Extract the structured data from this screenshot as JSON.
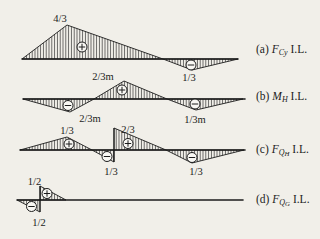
{
  "figure": {
    "bg_color": "#f1efe9",
    "ink_color": "#1c1c1c",
    "canvas": {
      "width": 320,
      "height": 239
    },
    "diagrams": [
      {
        "id": "a",
        "caption": {
          "prefix": "(a) ",
          "symbol": "F",
          "sub": "Cy",
          "subsub": "",
          "suffix": " I.L."
        },
        "caption_pos": {
          "x": 256,
          "y": 50
        },
        "baseline": {
          "x1": 22,
          "x2": 238,
          "y": 59
        },
        "regions": [
          {
            "points": "22,59 67,25 163,59",
            "sign": "plus",
            "sign_pos": {
              "x": 82,
              "y": 47
            }
          },
          {
            "points": "163,59 192,70 238,59",
            "sign": "minus",
            "sign_pos": {
              "x": 191,
              "y": 65
            }
          }
        ],
        "jumps": [],
        "labels": [
          {
            "text": "4/3",
            "x": 60,
            "y": 21.5
          },
          {
            "text": "1/3",
            "x": 189,
            "y": 81
          }
        ]
      },
      {
        "id": "b",
        "caption": {
          "prefix": "(b) ",
          "symbol": "M",
          "sub": "H",
          "subsub": "",
          "suffix": " I.L."
        },
        "caption_pos": {
          "x": 256,
          "y": 96.5
        },
        "baseline": {
          "x1": 23,
          "x2": 245,
          "y": 99
        },
        "regions": [
          {
            "points": "23,99 70,112 94,99",
            "sign": "minus",
            "sign_pos": {
              "x": 68,
              "y": 105.5
            }
          },
          {
            "points": "94,99 124,81 167,99",
            "sign": "plus",
            "sign_pos": {
              "x": 122,
              "y": 90
            }
          },
          {
            "points": "167,99 196,110 243,99",
            "sign": "minus",
            "sign_pos": {
              "x": 195,
              "y": 104
            }
          }
        ],
        "jumps": [],
        "labels": [
          {
            "text": "2/3m",
            "x": 103,
            "y": 79.5
          },
          {
            "text": "2/3m",
            "x": 90,
            "y": 122
          },
          {
            "text": "1/3m",
            "x": 195,
            "y": 122.5
          }
        ]
      },
      {
        "id": "c",
        "caption": {
          "prefix": "(c) ",
          "symbol": "F",
          "sub": "Q",
          "subsub": "H",
          "suffix": " I.L."
        },
        "caption_pos": {
          "x": 256,
          "y": 150
        },
        "baseline": {
          "x1": 20,
          "x2": 245,
          "y": 150
        },
        "regions": [
          {
            "points": "20,150 67,137 92,150",
            "sign": "plus",
            "sign_pos": {
              "x": 69,
              "y": 144
            }
          },
          {
            "points": "92,150 114,162 114,150",
            "sign": "minus",
            "sign_pos": {
              "x": 107,
              "y": 156.5
            }
          },
          {
            "points": "114,128 114,150 166,150",
            "sign": "plus",
            "sign_pos": {
              "x": 128,
              "y": 143.5
            }
          },
          {
            "points": "166,150 192,163 244,150",
            "sign": "minus",
            "sign_pos": {
              "x": 192,
              "y": 157.5
            }
          }
        ],
        "jumps": [
          {
            "x": 114,
            "y1": 162,
            "y2": 128
          }
        ],
        "labels": [
          {
            "text": "1/3",
            "x": 67,
            "y": 134
          },
          {
            "text": "2/3",
            "x": 128,
            "y": 132.5
          },
          {
            "text": "1/3",
            "x": 111,
            "y": 174.5
          },
          {
            "text": "1/3",
            "x": 196,
            "y": 174.5
          }
        ]
      },
      {
        "id": "d",
        "caption": {
          "prefix": "(d) ",
          "symbol": "F",
          "sub": "Q",
          "subsub": "G",
          "suffix": " I.L."
        },
        "caption_pos": {
          "x": 256,
          "y": 200
        },
        "baseline": {
          "x1": 17,
          "x2": 243,
          "y": 200
        },
        "regions": [
          {
            "points": "17,200 40,212 40,200",
            "sign": "minus",
            "sign_pos": {
              "x": 31.5,
              "y": 206.5
            }
          },
          {
            "points": "40,186 40,200 66,200",
            "sign": "plus",
            "sign_pos": {
              "x": 47,
              "y": 193.5
            }
          }
        ],
        "jumps": [
          {
            "x": 40,
            "y1": 212,
            "y2": 186
          }
        ],
        "labels": [
          {
            "text": "1/2",
            "x": 34.5,
            "y": 185
          },
          {
            "text": "1/2",
            "x": 39,
            "y": 225.5
          }
        ]
      }
    ]
  }
}
